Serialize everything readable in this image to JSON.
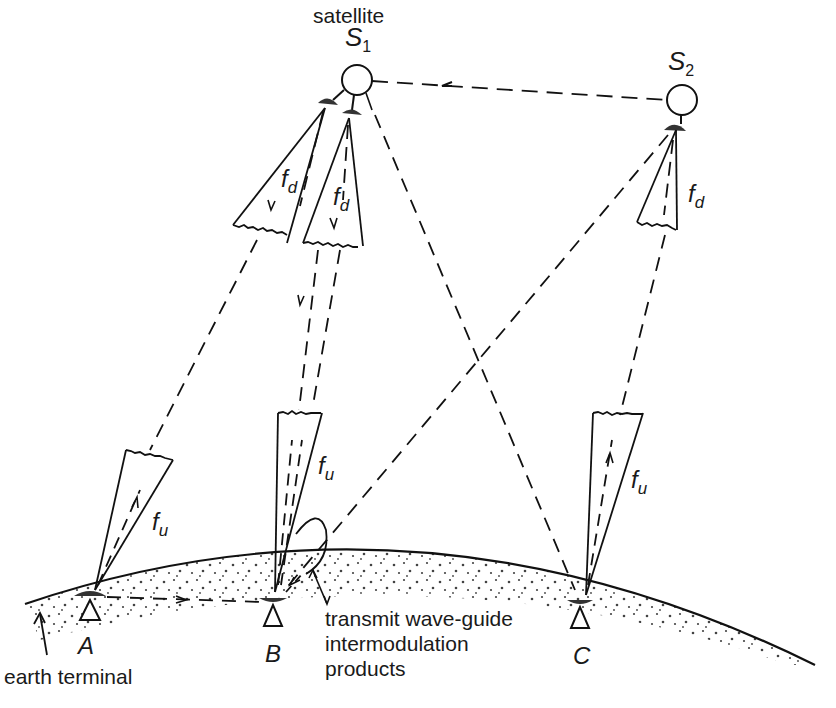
{
  "figure": {
    "labels": {
      "satellite": "satellite",
      "s1": "S",
      "s1_sub": "1",
      "s2": "S",
      "s2_sub": "2",
      "fd_symbol": "f",
      "fd_sub": "d",
      "fu_symbol": "f",
      "fu_sub": "u",
      "terminal_a": "A",
      "terminal_b": "B",
      "terminal_c": "C",
      "earth_terminal": "earth terminal",
      "waveguide_line1": "transmit wave-guide",
      "waveguide_line2": "intermodulation",
      "waveguide_line3": "products"
    },
    "nodes": {
      "satellites": [
        {
          "id": "S1",
          "label": "S1",
          "x": 357,
          "y": 80
        },
        {
          "id": "S2",
          "label": "S2",
          "x": 682,
          "y": 100
        }
      ],
      "earth_terminals": [
        {
          "id": "A",
          "label": "A",
          "x": 90,
          "y": 598
        },
        {
          "id": "B",
          "label": "B",
          "x": 272,
          "y": 600
        },
        {
          "id": "C",
          "label": "C",
          "x": 580,
          "y": 602
        }
      ]
    },
    "links": [
      {
        "from": "S2",
        "to": "S1",
        "style": "dashed",
        "type": "inter-satellite"
      },
      {
        "from": "S1",
        "to": "A",
        "style": "dashed",
        "type": "downlink",
        "freq": "fd"
      },
      {
        "from": "S1",
        "to": "B",
        "style": "dashed",
        "type": "downlink",
        "freq": "fd"
      },
      {
        "from": "S1",
        "to": "C",
        "style": "dashed",
        "type": "path"
      },
      {
        "from": "S2",
        "to": "B",
        "style": "dashed",
        "type": "path"
      },
      {
        "from": "A",
        "to": "B",
        "style": "dashed",
        "type": "ground"
      },
      {
        "from": "A",
        "to": "S1",
        "style": "dashed",
        "type": "uplink",
        "freq": "fu"
      },
      {
        "from": "B",
        "to": "S1",
        "style": "dashed",
        "type": "uplink",
        "freq": "fu"
      },
      {
        "from": "C",
        "to": "S2",
        "style": "dashed",
        "type": "uplink",
        "freq": "fu"
      }
    ]
  }
}
